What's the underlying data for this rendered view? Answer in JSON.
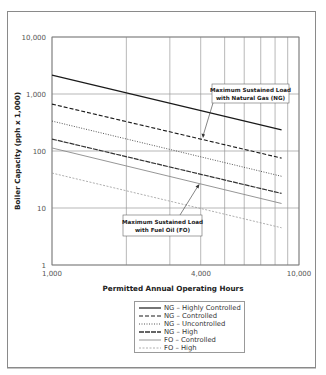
{
  "chart_data": {
    "type": "line",
    "title": "",
    "xlabel": "Permitted Annual Operating Hours",
    "ylabel": "Boiler Capacity (pph x 1,000)",
    "xscale": "log",
    "yscale": "log",
    "xlim": [
      1000,
      10000
    ],
    "ylim": [
      1,
      10000
    ],
    "x_tick_labels": [
      "1,000",
      "4,000",
      "10,000"
    ],
    "y_tick_labels": [
      "10,000",
      "1,000",
      "100",
      "10",
      "1"
    ],
    "x_gridlines": [
      1000,
      2000,
      3000,
      4000,
      5000,
      6000,
      7000,
      8000,
      9000,
      10000
    ],
    "y_gridlines": [
      1,
      10,
      100,
      1000,
      10000
    ],
    "grid": true,
    "x": [
      1000,
      8500
    ],
    "series": [
      {
        "name": "NG – Highly Controlled",
        "values": [
          2150,
          234
        ],
        "style": "solid",
        "color": "#1a1a1a",
        "width": 1.2
      },
      {
        "name": "NG – Controlled",
        "values": [
          665,
          75
        ],
        "style": "dashed",
        "color": "#1a1a1a",
        "width": 1.1
      },
      {
        "name": "NG – Uncontrolled",
        "values": [
          335,
          36
        ],
        "style": "dotted",
        "color": "#444444",
        "width": 0.9
      },
      {
        "name": "NG – High",
        "values": [
          162,
          18
        ],
        "style": "longdash",
        "color": "#333333",
        "width": 1.2
      },
      {
        "name": "FO – Controlled",
        "values": [
          113,
          12
        ],
        "style": "solid",
        "color": "#8a8a8a",
        "width": 0.9
      },
      {
        "name": "FO – High",
        "values": [
          41,
          4.5
        ],
        "style": "dashed-light",
        "color": "#9a9a9a",
        "width": 0.8
      }
    ],
    "annotations": [
      {
        "text_lines": [
          "Maximum Sustained Load",
          "with Natural Gas (NG)"
        ],
        "points_to": "NG – Controlled"
      },
      {
        "text_lines": [
          "Maximum Sustained Load",
          "with Fuel Oil (FO)"
        ],
        "points_to": "FO – Controlled"
      }
    ],
    "legend_position": "bottom-center"
  },
  "legend": {
    "items": [
      {
        "label": "NG – Highly Controlled"
      },
      {
        "label": "NG – Controlled"
      },
      {
        "label": "NG – Uncontrolled"
      },
      {
        "label": "NG – High"
      },
      {
        "label": "FO – Controlled"
      },
      {
        "label": "FO – High"
      }
    ]
  }
}
